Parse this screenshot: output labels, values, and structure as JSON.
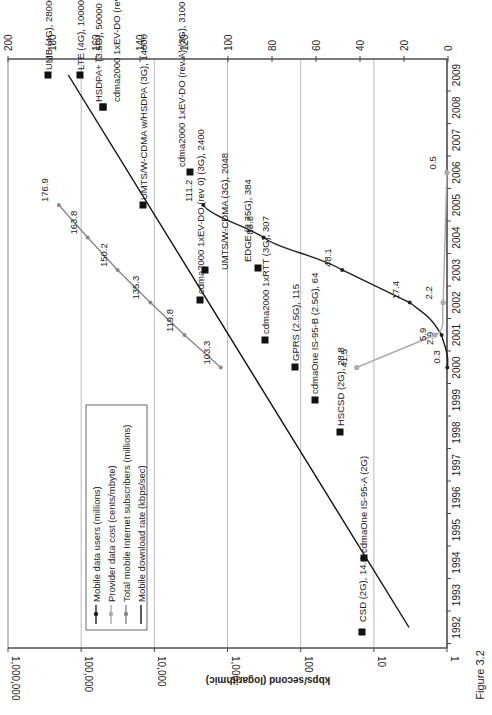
{
  "figure_caption": "Figure 3.2",
  "chart_data": {
    "type": "line",
    "orientation": "rotated 90° counter-clockwise (x axis = years runs down the right side)",
    "title": "",
    "xlabel": "",
    "ylabel": "kbps/second (logarithmic)",
    "y2label": "",
    "x_ticks": [
      "1992",
      "1993",
      "1994",
      "1995",
      "1996",
      "1997",
      "1998",
      "1999",
      "2000",
      "2001",
      "2002",
      "2003",
      "2004",
      "2005",
      "2006",
      "2007",
      "2008",
      "2009"
    ],
    "y_ticks": [
      "1",
      "10",
      "100",
      "1,000",
      "10,000",
      "100,000",
      "1,000,000"
    ],
    "y2_ticks": [
      "0",
      "20",
      "40",
      "60",
      "80",
      "100",
      "120",
      "140",
      "160",
      "180",
      "200"
    ],
    "ylim": [
      1,
      1000000
    ],
    "y2lim": [
      0,
      200
    ],
    "grid": true,
    "legend": [
      {
        "label": "Mobile data users (millions)",
        "color": "#222222",
        "marker": "diamond"
      },
      {
        "label": "Provider data cost (cents/mbyte)",
        "color": "#aaaaaa",
        "marker": "circle"
      },
      {
        "label": "Total mobile Internet subscribers (millions)",
        "color": "#888888",
        "marker": "diamond"
      },
      {
        "label": "Mobile download rate (kbps/sec)",
        "color": "#111111",
        "marker": "none"
      }
    ],
    "series": [
      {
        "name": "Mobile data users (millions)",
        "axis": "secondary",
        "color": "#222222",
        "x": [
          2000,
          2001,
          2002,
          2003,
          2004,
          2005
        ],
        "values": [
          0.3,
          2.9,
          17.4,
          48.1,
          83.8,
          111.2
        ]
      },
      {
        "name": "Provider data cost (cents/mbyte)",
        "axis": "secondary",
        "color": "#aaaaaa",
        "x": [
          2000,
          2001,
          2002,
          2006
        ],
        "values": [
          41.5,
          5.9,
          2.2,
          0.5
        ]
      },
      {
        "name": "Total mobile Internet subscribers (millions)",
        "axis": "secondary",
        "color": "#888888",
        "x": [
          2000,
          2001,
          2002,
          2003,
          2004,
          2005
        ],
        "values": [
          103.3,
          119.8,
          135.3,
          150.2,
          163.8,
          176.9
        ]
      },
      {
        "name": "Mobile download rate (kbps/sec) trend",
        "axis": "primary",
        "color": "#111111",
        "x": [
          1992,
          2009
        ],
        "values": [
          3.3,
          150000
        ]
      }
    ],
    "technologies": [
      {
        "label": "CSD (2G), 14.4",
        "year": 1992,
        "kbps": 14.4
      },
      {
        "label": "cdmaOne IS-95-A (2G)",
        "year": 1995,
        "kbps": 14.4
      },
      {
        "label": "HSCSD (2G), 28.8",
        "year": 1998,
        "kbps": 28.8
      },
      {
        "label": "cdmaOne IS-95-B (2.5G), 64",
        "year": 1999,
        "kbps": 64
      },
      {
        "label": "GPRS (2.5G), 115",
        "year": 2000,
        "kbps": 115
      },
      {
        "label": "cdma2000 1xRTT (3G), 307",
        "year": 2000,
        "kbps": 307
      },
      {
        "label": "EDGE (2.75G), 384",
        "year": 2003,
        "kbps": 384
      },
      {
        "label": "cdma2000 1xEV-DO (rev 0) (3G), 2400",
        "year": 2002,
        "kbps": 2400
      },
      {
        "label": "UMTS/W-CDMA (3G), 2048",
        "year": 2003,
        "kbps": 2048
      },
      {
        "label": "cdma2000 1xEV-DO (rev A) (3G), 3100",
        "year": 2006,
        "kbps": 3100
      },
      {
        "label": "UMTS/W-CDMA w/HSDPA (3G), 14000",
        "year": 2005,
        "kbps": 14000
      },
      {
        "label": "cdma2000 1xEV-DO (rev B) (3.5G), 46500",
        "year": 2008,
        "kbps": 46500
      },
      {
        "label": "HSDPA+ (3.5G), 50000",
        "year": 2008,
        "kbps": 50000
      },
      {
        "label": "LTE (4G), 100000",
        "year": 2009,
        "kbps": 100000
      },
      {
        "label": "UMB (4G), 280000",
        "year": 2009,
        "kbps": 280000
      }
    ]
  }
}
